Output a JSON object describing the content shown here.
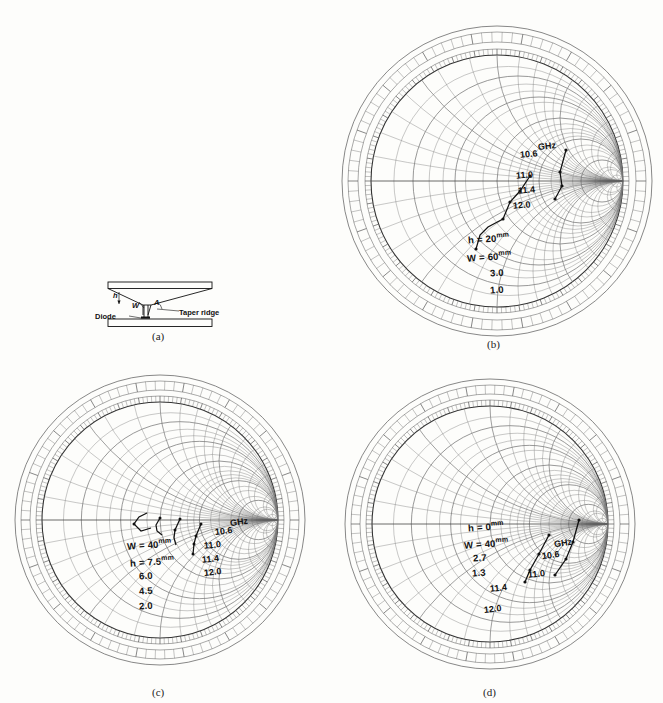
{
  "figure": {
    "panels": [
      {
        "id": "a",
        "caption": "(a)",
        "type": "schematic",
        "labels": {
          "h": "h",
          "w": "W",
          "a": "A",
          "diode": "Diode",
          "taper_ridge": "Taper  ridge"
        }
      },
      {
        "id": "b",
        "caption": "(b)",
        "type": "smith-chart",
        "annotations": [
          {
            "text": "h = 20",
            "unit": "mm"
          },
          {
            "text": "W = 60",
            "unit": "mm"
          },
          {
            "text": "3.0",
            "unit": ""
          },
          {
            "text": "1.0",
            "unit": ""
          }
        ],
        "frequency_unit": "GHz",
        "frequency_markers": [
          "10.6",
          "11.0",
          "11.4",
          "12.0"
        ]
      },
      {
        "id": "c",
        "caption": "(c)",
        "type": "smith-chart",
        "annotations": [
          {
            "text": "W = 40",
            "unit": "mm"
          },
          {
            "text": "h = 7.5",
            "unit": "mm"
          },
          {
            "text": "6.0",
            "unit": ""
          },
          {
            "text": "4.5",
            "unit": ""
          },
          {
            "text": "2.0",
            "unit": ""
          }
        ],
        "frequency_unit": "GHz",
        "frequency_markers": [
          "10.6",
          "11.0",
          "11.4",
          "12.0"
        ]
      },
      {
        "id": "d",
        "caption": "(d)",
        "type": "smith-chart",
        "annotations": [
          {
            "text": "h = 0",
            "unit": "mm"
          },
          {
            "text": "W = 40",
            "unit": "mm"
          },
          {
            "text": "2.7",
            "unit": ""
          },
          {
            "text": "1.3",
            "unit": ""
          }
        ],
        "frequency_unit": "GHz",
        "frequency_markers": [
          "10.6",
          "11.0",
          "11.4",
          "12.0"
        ]
      }
    ]
  },
  "chart_data": [
    {
      "panel": "b",
      "type": "scatter",
      "title": "",
      "chart_kind": "smith-chart",
      "xlabel": "",
      "ylabel": "",
      "xlim": [
        -1,
        1
      ],
      "ylim": [
        -1,
        1
      ],
      "grid": true,
      "legend": "none",
      "parameters": {
        "h_mm": 20,
        "W_mm": 60
      },
      "frequency_unit": "GHz",
      "frequency_labels": [
        10.6,
        11.0,
        11.4,
        12.0
      ],
      "series": [
        {
          "name": "3.0",
          "points": [
            {
              "f": 10.6,
              "x": 0.545,
              "y": 0.245
            },
            {
              "f": 11.0,
              "x": 0.5,
              "y": 0.075
            },
            {
              "f": 11.4,
              "x": 0.515,
              "y": -0.035
            },
            {
              "f": 12.0,
              "x": 0.465,
              "y": -0.135
            }
          ]
        },
        {
          "name": "1.0",
          "points": [
            {
              "f": 10.6,
              "x": 0.26,
              "y": 0.04
            },
            {
              "f": 11.0,
              "x": 0.185,
              "y": -0.075
            },
            {
              "f": 11.4,
              "x": 0.105,
              "y": -0.165
            },
            {
              "f": 12.0,
              "x": 0.05,
              "y": -0.3
            }
          ]
        }
      ]
    },
    {
      "panel": "c",
      "type": "scatter",
      "chart_kind": "smith-chart",
      "xlim": [
        -1,
        1
      ],
      "ylim": [
        -1,
        1
      ],
      "grid": true,
      "legend": "none",
      "parameters": {
        "W_mm": 40,
        "h_mm": 7.5
      },
      "frequency_unit": "GHz",
      "frequency_labels": [
        10.6,
        11.0,
        11.4,
        12.0
      ],
      "series": [
        {
          "name": "7.5",
          "points": [
            {
              "f": 10.6,
              "x": 0.345,
              "y": -0.035
            },
            {
              "f": 11.0,
              "x": 0.305,
              "y": -0.135
            },
            {
              "f": 11.4,
              "x": 0.285,
              "y": -0.205
            },
            {
              "f": 12.0,
              "x": 0.275,
              "y": -0.285
            }
          ]
        },
        {
          "name": "6.0",
          "points": [
            {
              "f": 10.6,
              "x": 0.175,
              "y": 0.005
            },
            {
              "f": 11.0,
              "x": 0.135,
              "y": -0.085
            },
            {
              "f": 11.4,
              "x": 0.125,
              "y": -0.155
            },
            {
              "f": 12.0,
              "x": 0.145,
              "y": -0.215
            }
          ]
        },
        {
          "name": "4.5",
          "points": [
            {
              "f": 10.6,
              "x": 0.005,
              "y": 0.015
            },
            {
              "f": 11.0,
              "x": -0.035,
              "y": -0.04
            },
            {
              "f": 11.4,
              "x": -0.025,
              "y": -0.095
            },
            {
              "f": 12.0,
              "x": 0.015,
              "y": -0.13
            }
          ]
        }
      ]
    },
    {
      "panel": "d",
      "type": "scatter",
      "chart_kind": "smith-chart",
      "xlim": [
        -1,
        1
      ],
      "ylim": [
        -1,
        1
      ],
      "grid": true,
      "legend": "none",
      "parameters": {
        "h_mm": 0,
        "W_mm": 40
      },
      "frequency_unit": "GHz",
      "frequency_labels": [
        10.6,
        11.0,
        11.4,
        12.0
      ],
      "series": [
        {
          "name": "2.7",
          "points": [
            {
              "f": 10.6,
              "x": 0.755,
              "y": 0.03
            },
            {
              "f": 11.0,
              "x": 0.7,
              "y": -0.155
            },
            {
              "f": 11.4,
              "x": 0.645,
              "y": -0.3
            },
            {
              "f": 12.0,
              "x": 0.595,
              "y": -0.43
            }
          ]
        },
        {
          "name": "1.3",
          "points": [
            {
              "f": 10.6,
              "x": 0.5,
              "y": -0.095
            },
            {
              "f": 11.0,
              "x": 0.415,
              "y": -0.255
            },
            {
              "f": 11.4,
              "x": 0.335,
              "y": -0.385
            },
            {
              "f": 12.0,
              "x": 0.295,
              "y": -0.49
            }
          ]
        }
      ]
    }
  ]
}
